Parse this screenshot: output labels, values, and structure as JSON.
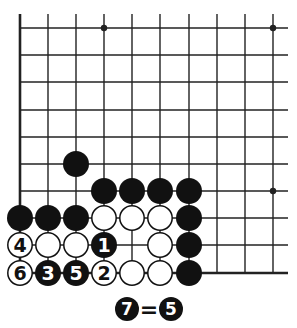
{
  "diagram": {
    "grid": {
      "columns_x": [
        20,
        48,
        76,
        104,
        132,
        160,
        189,
        217,
        245,
        273
      ],
      "rows_y": [
        28,
        55,
        82,
        110,
        137,
        164,
        191,
        218,
        245,
        273
      ],
      "top_extend_y": 14,
      "right_extend_x": 288,
      "left_edge_thick": true,
      "bottom_edge_thick": true,
      "line_color": "#222222"
    },
    "star_points": [
      {
        "col": 3,
        "row": 0
      },
      {
        "col": 9,
        "row": 0
      },
      {
        "col": 9,
        "row": 6
      }
    ],
    "stones": [
      {
        "col": 2,
        "row": 5,
        "color": "black",
        "label": ""
      },
      {
        "col": 3,
        "row": 6,
        "color": "black",
        "label": ""
      },
      {
        "col": 4,
        "row": 6,
        "color": "black",
        "label": ""
      },
      {
        "col": 5,
        "row": 6,
        "color": "black",
        "label": ""
      },
      {
        "col": 6,
        "row": 6,
        "color": "black",
        "label": ""
      },
      {
        "col": 0,
        "row": 7,
        "color": "black",
        "label": ""
      },
      {
        "col": 1,
        "row": 7,
        "color": "black",
        "label": ""
      },
      {
        "col": 2,
        "row": 7,
        "color": "black",
        "label": ""
      },
      {
        "col": 3,
        "row": 7,
        "color": "white",
        "label": ""
      },
      {
        "col": 4,
        "row": 7,
        "color": "white",
        "label": ""
      },
      {
        "col": 5,
        "row": 7,
        "color": "white",
        "label": ""
      },
      {
        "col": 6,
        "row": 7,
        "color": "black",
        "label": ""
      },
      {
        "col": 0,
        "row": 8,
        "color": "white",
        "label": "4"
      },
      {
        "col": 1,
        "row": 8,
        "color": "white",
        "label": ""
      },
      {
        "col": 2,
        "row": 8,
        "color": "white",
        "label": ""
      },
      {
        "col": 3,
        "row": 8,
        "color": "black",
        "label": "1"
      },
      {
        "col": 5,
        "row": 8,
        "color": "white",
        "label": ""
      },
      {
        "col": 6,
        "row": 8,
        "color": "black",
        "label": ""
      },
      {
        "col": 0,
        "row": 9,
        "color": "white",
        "label": "6"
      },
      {
        "col": 1,
        "row": 9,
        "color": "black",
        "label": "3"
      },
      {
        "col": 2,
        "row": 9,
        "color": "black",
        "label": "5"
      },
      {
        "col": 3,
        "row": 9,
        "color": "white",
        "label": "2"
      },
      {
        "col": 4,
        "row": 9,
        "color": "white",
        "label": ""
      },
      {
        "col": 5,
        "row": 9,
        "color": "white",
        "label": ""
      },
      {
        "col": 6,
        "row": 9,
        "color": "black",
        "label": ""
      }
    ],
    "caption": {
      "left_stone": {
        "color": "black",
        "label": "7"
      },
      "operator": "=",
      "right_stone": {
        "color": "black",
        "label": "5"
      }
    }
  }
}
